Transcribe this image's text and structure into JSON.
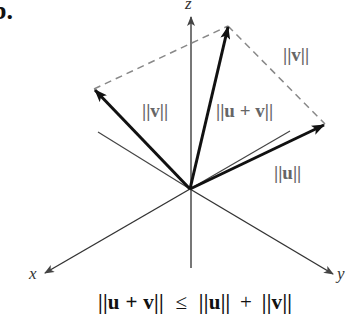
{
  "figure": {
    "part_label": "b.",
    "axes": {
      "x": "x",
      "y": "y",
      "z": "z"
    },
    "vector_labels": {
      "v_left": "||v||",
      "v_right": "||v||",
      "u_plus_v": "||u + v||",
      "u": "||u||"
    },
    "formula": {
      "lhs": "||u + v||",
      "relation": "≤",
      "rhs_u": "||u||",
      "plus": "+",
      "rhs_v": "||v||"
    },
    "colors": {
      "axis": "#555555",
      "vector": "#111111",
      "dashed": "#888888",
      "label": "#666666"
    }
  }
}
